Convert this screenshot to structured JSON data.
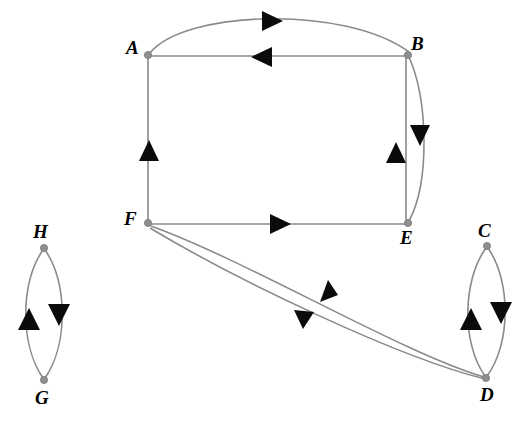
{
  "diagram": {
    "type": "directed-graph",
    "background_color": "#ffffff",
    "edge_color": "#8a8a8a",
    "arrow_color": "#0b0b0b",
    "node_color": "#8e8e8e",
    "node_count": 8,
    "edge_count": 14
  },
  "nodes": [
    {
      "id": "A",
      "label": "A",
      "x": 148,
      "y": 55,
      "label_x": 126,
      "label_y": 38
    },
    {
      "id": "B",
      "label": "B",
      "x": 408,
      "y": 55,
      "label_x": 411,
      "label_y": 34
    },
    {
      "id": "C",
      "label": "C",
      "x": 487,
      "y": 246,
      "label_x": 478,
      "label_y": 221
    },
    {
      "id": "D",
      "label": "D",
      "x": 486,
      "y": 378,
      "label_x": 480,
      "label_y": 385
    },
    {
      "id": "E",
      "label": "E",
      "x": 408,
      "y": 223,
      "label_x": 400,
      "label_y": 228
    },
    {
      "id": "F",
      "label": "F",
      "x": 148,
      "y": 223,
      "label_x": 124,
      "label_y": 209
    },
    {
      "id": "G",
      "label": "G",
      "x": 44,
      "y": 380,
      "label_x": 35,
      "label_y": 388
    },
    {
      "id": "H",
      "label": "H",
      "x": 44,
      "y": 248,
      "label_x": 33,
      "label_y": 222
    }
  ],
  "edges": [
    {
      "id": "A-B-curve",
      "from": "A",
      "to": "B",
      "shape": "curve",
      "arrow": "right",
      "arrow_x": 271,
      "arrow_y": 21,
      "name": "edge-a-to-b"
    },
    {
      "id": "B-A-line",
      "from": "B",
      "to": "A",
      "shape": "straight",
      "arrow": "left",
      "arrow_x": 262,
      "arrow_y": 57,
      "name": "edge-b-to-a"
    },
    {
      "id": "F-A-line",
      "from": "F",
      "to": "A",
      "shape": "straight",
      "arrow": "up",
      "arrow_x": 149,
      "arrow_y": 149,
      "name": "edge-f-to-a"
    },
    {
      "id": "B-E-curve",
      "from": "B",
      "to": "E",
      "shape": "curve",
      "arrow": "down",
      "arrow_x": 420,
      "arrow_y": 135,
      "name": "edge-b-to-e"
    },
    {
      "id": "E-B-line",
      "from": "E",
      "to": "B",
      "shape": "straight",
      "arrow": "up",
      "arrow_x": 396,
      "arrow_y": 151,
      "name": "edge-e-to-b"
    },
    {
      "id": "F-E-line",
      "from": "F",
      "to": "E",
      "shape": "straight",
      "arrow": "right",
      "arrow_x": 281,
      "arrow_y": 224,
      "name": "edge-f-to-e"
    },
    {
      "id": "F-D-curve",
      "from": "F",
      "to": "D",
      "shape": "curve",
      "arrow": "down-right",
      "arrow_x": 304,
      "arrow_y": 320,
      "name": "edge-f-to-d"
    },
    {
      "id": "D-F-curve",
      "from": "D",
      "to": "F",
      "shape": "curve",
      "arrow": "up-left",
      "arrow_x": 330,
      "arrow_y": 292,
      "name": "edge-d-to-f"
    },
    {
      "id": "G-H-curve",
      "from": "G",
      "to": "H",
      "shape": "curve",
      "arrow": "up",
      "arrow_x": 29,
      "arrow_y": 318,
      "name": "edge-g-to-h"
    },
    {
      "id": "H-G-curve",
      "from": "H",
      "to": "G",
      "shape": "curve",
      "arrow": "down",
      "arrow_x": 59,
      "arrow_y": 315,
      "name": "edge-h-to-g"
    },
    {
      "id": "D-C-curve",
      "from": "D",
      "to": "C",
      "shape": "curve",
      "arrow": "up",
      "arrow_x": 471,
      "arrow_y": 318,
      "name": "edge-d-to-c"
    },
    {
      "id": "C-D-curve",
      "from": "C",
      "to": "D",
      "shape": "curve",
      "arrow": "down",
      "arrow_x": 501,
      "arrow_y": 313,
      "name": "edge-c-to-d"
    }
  ]
}
